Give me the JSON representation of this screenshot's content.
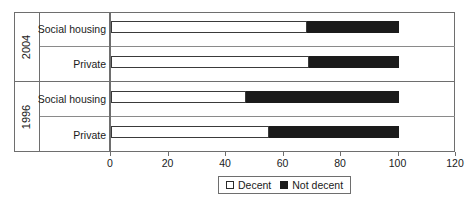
{
  "chart_data": {
    "type": "bar",
    "orientation": "horizontal",
    "stacked": true,
    "title": "",
    "xlabel": "",
    "ylabel": "",
    "xlim": [
      0,
      120
    ],
    "xticks": [
      0,
      20,
      40,
      60,
      80,
      100,
      120
    ],
    "xticklabels": [
      "0",
      "20",
      "40",
      "60",
      "80",
      "100",
      "120"
    ],
    "grid": false,
    "legend_position": "bottom-center",
    "groups": [
      {
        "year": "2004",
        "categories": [
          "Social housing",
          "Private"
        ]
      },
      {
        "year": "1996",
        "categories": [
          "Social housing",
          "Private"
        ]
      }
    ],
    "categories": [
      "2004 Social housing",
      "2004 Private",
      "1996 Social housing",
      "1996 Private"
    ],
    "series": [
      {
        "name": "Decent",
        "color": "#ffffff",
        "values": [
          68,
          69,
          47,
          55
        ]
      },
      {
        "name": "Not decent",
        "color": "#1b1b1b",
        "values": [
          32,
          31,
          53,
          45
        ]
      }
    ],
    "bars": [
      {
        "group": "2004",
        "category": "Social housing",
        "decent": 68,
        "not_decent": 32,
        "total": 100
      },
      {
        "group": "2004",
        "category": "Private",
        "decent": 69,
        "not_decent": 31,
        "total": 100
      },
      {
        "group": "1996",
        "category": "Social housing",
        "decent": 47,
        "not_decent": 53,
        "total": 100
      },
      {
        "group": "1996",
        "category": "Private",
        "decent": 55,
        "not_decent": 45,
        "total": 100
      }
    ],
    "legend": [
      {
        "label": "Decent",
        "swatch": "white-square-icon"
      },
      {
        "label": "Not decent",
        "swatch": "black-square-icon"
      }
    ]
  },
  "labels": {
    "year_2004": "2004",
    "year_1996": "1996",
    "cat_social_housing": "Social housing",
    "cat_private": "Private"
  },
  "ticks": {
    "t0": "0",
    "t1": "20",
    "t2": "40",
    "t3": "60",
    "t4": "80",
    "t5": "100",
    "t6": "120"
  },
  "legend": {
    "decent": "Decent",
    "not_decent": "Not decent"
  },
  "colors": {
    "decent": "#ffffff",
    "not_decent": "#1b1b1b",
    "frame": "#6e6e6e",
    "text": "#1a1a1a"
  }
}
